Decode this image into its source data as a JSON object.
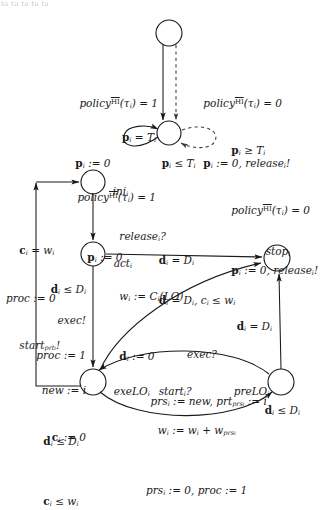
{
  "figure": {
    "title_fragment": "ta ta ta ta ta",
    "kind": "timed-automaton-diagram"
  },
  "nodes": [
    {
      "id": "top",
      "label": "",
      "cx": 169,
      "cy": 33,
      "r": 13
    },
    {
      "id": "mid",
      "label": "",
      "cx": 169,
      "cy": 133,
      "r": 12
    },
    {
      "id": "ini",
      "label": "ini",
      "sub": "i",
      "cx": 93,
      "cy": 182,
      "r": 12
    },
    {
      "id": "act",
      "label": "act",
      "sub": "i",
      "cx": 93,
      "cy": 254,
      "r": 12
    },
    {
      "id": "stop",
      "label": "stop",
      "sub": "i",
      "cx": 277,
      "cy": 258,
      "r": 13
    },
    {
      "id": "exeLO",
      "label": "exeLO",
      "sub": "i",
      "cx": 93,
      "cy": 382,
      "r": 13
    },
    {
      "id": "preLO",
      "label": "preLO",
      "sub": "i",
      "cx": 281,
      "cy": 382,
      "r": 13
    }
  ],
  "labels": {
    "policy_true_guard": "policy",
    "policy_sup": "HI",
    "policy_tau_eq1": "(τ",
    "policy_tau_close1": ") = 1",
    "policy_tau_close0": ") = 0",
    "p_assign_zero": "p",
    "p_assign_zero_rest": " := 0",
    "p_assign_zero_rel": " := 0, ",
    "release_bang": "release",
    "bang": "!",
    "p_eq_T": "p",
    "eq_T": " = T",
    "p_ge_T": "p",
    "ge_T": " ≥ T",
    "p_le_T": "p",
    "le_T": " ≤ T",
    "release_q": "release",
    "question": "?",
    "w_assign_C": "w",
    "w_assign_C_rest": " := C",
    "w_assign_C_LO": "(LO)",
    "d_assign_zero": "d",
    "d_assign_zero_rest": " := 0",
    "c_eq_w": "c",
    "c_eq_w_rest": " = w",
    "proc_assign_0": "proc := 0",
    "start_prt": "start",
    "start_prt_sub": "prt",
    "d_le_D": "d",
    "d_le_D_rest": " ≤ D",
    "c_le_w": "c",
    "c_le_w_rest": " ≤ w",
    "exec_bang": "exec!",
    "proc_assign_1": "proc := 1",
    "new_assign_i": "new := i",
    "c_assign_0": "c",
    "c_assign_0_rest": " := 0",
    "d_eq_D": "d",
    "d_eq_D_rest": " = D",
    "d_eq_D_c_le_w": ", c",
    "exec_q": "exec?",
    "prs_assign_new": "prs",
    "prs_assign_new_rest": " := new, prt",
    "prt_prs_sub": "prs",
    "prt_assign_i": " := i",
    "start_i_q": "start",
    "w_plus_w": "w",
    "w_plus_w_mid": " := w",
    "w_plus_w_rest": " + w",
    "w_prs_sub": "prs",
    "prs_assign_0": "prs",
    "prs_assign_0_rest": " := 0, proc := 1",
    "i": "i",
    "tau_sub": "i",
    "idx": "i"
  },
  "edge_annotations": {
    "top_left": {
      "line1_pre": "policy",
      "line1_sup": "HI",
      "line1_mid": "(τ",
      "line1_sub": "i",
      "line1_post": ") = 1",
      "line2_bf": "p",
      "line2_sub": "i",
      "line2_post": " := 0"
    },
    "top_right": {
      "line1_pre": "policy",
      "line1_sup": "HI",
      "line1_mid": "(τ",
      "line1_sub": "i",
      "line1_post": ") = 0",
      "line2_bf": "p",
      "line2_sub": "i",
      "line2_post": " := 0, ",
      "line2_it": "release",
      "line2_it_sub": "i",
      "line2_bang": "!"
    },
    "mid_left": {
      "line1_bf": "p",
      "line1_sub": "i",
      "line1_post": " = T",
      "line1_sub2": "i",
      "line2_pre": "policy",
      "line2_sup": "HI",
      "line2_mid": "(τ",
      "line2_sub": "i",
      "line2_post": ") = 1",
      "line3_bf": "p",
      "line3_sub": "i",
      "line3_post": " := 0"
    },
    "mid_right": {
      "line1_bf": "p",
      "line1_sub": "i",
      "line1_post": " ≥ T",
      "line1_sub2": "i",
      "line2_pre": "policy",
      "line2_sup": "HI",
      "line2_mid": "(τ",
      "line2_sub": "i",
      "line2_post": ") = 0",
      "line3_bf": "p",
      "line3_sub": "i",
      "line3_post": " := 0, ",
      "line3_it": "release",
      "line3_it_sub": "i",
      "line3_bang": "!"
    },
    "mid_invariant": {
      "bf": "p",
      "sub": "i",
      "post": " ≤ T",
      "sub2": "i"
    }
  },
  "colors": {
    "stroke": "#1a1a1a",
    "background": "#ffffff",
    "dashed": "#3a3a3a"
  }
}
